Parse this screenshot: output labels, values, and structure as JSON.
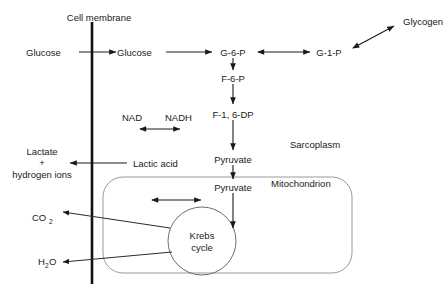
{
  "diagram": {
    "background_color": "#ffffff",
    "ink_color": "#1a1a1a",
    "organelle_outline_color": "#9a9a9a",
    "membrane_color": "#111111"
  },
  "labels": {
    "cell_membrane": "Cell membrane",
    "glucose_outside": "Glucose",
    "glucose_inside": "Glucose",
    "g6p": "G-6-P",
    "g1p": "G-1-P",
    "glycogen": "Glycogen",
    "f6p": "F-6-P",
    "f16dp": "F-1, 6-DP",
    "nad": "NAD",
    "nadh": "NADH",
    "pyruvate_sarcoplasm": "Pyruvate",
    "pyruvate_mitochondrion": "Pyruvate",
    "lactic_acid": "Lactic acid",
    "lactate_line1": "Lactate",
    "lactate_line2": "+",
    "lactate_line3": "hydrogen ions",
    "co2_main": "CO",
    "co2_sub": "2",
    "h2o_main": "H",
    "h2o_sub": "2",
    "h2o_tail": "O",
    "sarcoplasm": "Sarcoplasm",
    "mitochondrion": "Mitochondrion",
    "krebs_line1": "Krebs",
    "krebs_line2": "cycle"
  }
}
